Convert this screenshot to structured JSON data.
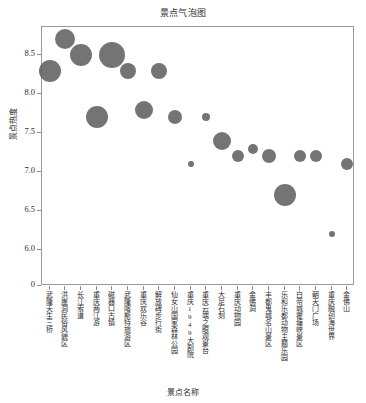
{
  "chart_data": {
    "type": "scatter",
    "title": "景点气泡图",
    "xlabel": "景点名称",
    "ylabel": "景点热度",
    "ylim": [
      5.75,
      8.85
    ],
    "y_ticks": [
      "0",
      "6.0",
      "6.5",
      "7.0",
      "7.5",
      "8.0",
      "8.5"
    ],
    "grid": false,
    "legend": "none",
    "bubble_color": "#5c5c5c",
    "categories": [
      "武隆天生三桥",
      "洪崖洞民俗风貌区",
      "长江索道",
      "重庆两江游",
      "磁器口古镇",
      "武隆喀斯特旅游区",
      "重庆欢乐谷",
      "解放碑步行街",
      "仙女山国家森林公园",
      "重庆1949大剧院",
      "重庆云端之眼观景台",
      "大足石刻",
      "重庆动物园",
      "金佛洞",
      "丰都鬼城名山景区",
      "乐和乐都动物主题乐园",
      "白帝城瞿塘峡景区",
      "朝天门广场",
      "重庆融创海世界",
      "金佛山"
    ],
    "values": [
      8.3,
      8.7,
      8.5,
      7.7,
      8.5,
      8.3,
      7.8,
      8.3,
      7.7,
      7.1,
      7.7,
      7.4,
      7.2,
      7.3,
      7.2,
      6.7,
      7.2,
      7.2,
      6.2,
      7.1
    ],
    "sizes": [
      11,
      10,
      11,
      11,
      13,
      10,
      8,
      8,
      7,
      3,
      4,
      9,
      6,
      5,
      7,
      11,
      6,
      6,
      3,
      6
    ],
    "points": [
      {
        "label": "武隆天生三桥",
        "value": 8.3,
        "size": 11
      },
      {
        "label": "洪崖洞民俗风貌区",
        "value": 8.7,
        "size": 10
      },
      {
        "label": "长江索道",
        "value": 8.5,
        "size": 11
      },
      {
        "label": "重庆两江游",
        "value": 7.7,
        "size": 11
      },
      {
        "label": "磁器口古镇",
        "value": 8.5,
        "size": 13
      },
      {
        "label": "武隆喀斯特旅游区",
        "value": 8.3,
        "size": 8
      },
      {
        "label": "重庆欢乐谷",
        "value": 7.8,
        "size": 9
      },
      {
        "label": "解放碑步行街",
        "value": 8.3,
        "size": 8
      },
      {
        "label": "仙女山国家森林公园",
        "value": 7.7,
        "size": 7
      },
      {
        "label": "重庆1949大剧院",
        "value": 7.1,
        "size": 3
      },
      {
        "label": "重庆云端之眼观景台",
        "value": 7.7,
        "size": 4
      },
      {
        "label": "大足石刻",
        "value": 7.4,
        "size": 9
      },
      {
        "label": "重庆动物园",
        "value": 7.2,
        "size": 6
      },
      {
        "label": "金佛洞",
        "value": 7.3,
        "size": 5
      },
      {
        "label": "丰都鬼城名山景区",
        "value": 7.2,
        "size": 7
      },
      {
        "label": "乐和乐都动物主题乐园",
        "value": 6.7,
        "size": 11
      },
      {
        "label": "白帝城瞿塘峡景区",
        "value": 7.2,
        "size": 6
      },
      {
        "label": "朝天门广场",
        "value": 7.2,
        "size": 6
      },
      {
        "label": "重庆融创海世界",
        "value": 6.2,
        "size": 3
      },
      {
        "label": "金佛山",
        "value": 7.1,
        "size": 6
      }
    ]
  }
}
